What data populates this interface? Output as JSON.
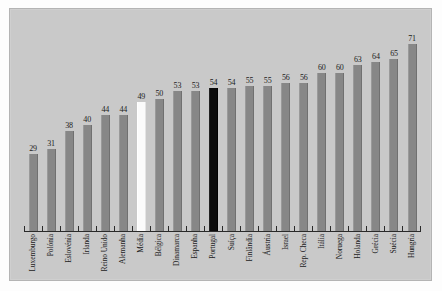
{
  "chart_data": {
    "type": "bar",
    "title": "",
    "subtitle": "",
    "xlabel": "",
    "ylabel": "",
    "ylim": [
      0,
      75
    ],
    "grid": false,
    "legend": "none",
    "orientation": "vertical",
    "categories": [
      "Luxemburgo",
      "Polónia",
      "Eslovénia",
      "Irlanda",
      "Reino Unido",
      "Alemanha",
      "Média",
      "Bélgica",
      "Dinamarca",
      "Espanha",
      "Portugal",
      "Suíça",
      "Finlândia",
      "Áustria",
      "Israel",
      "Rep. Checa",
      "Itália",
      "Noruega",
      "Holanda",
      "Grécia",
      "Suécia",
      "Hungria"
    ],
    "values": [
      29,
      31,
      38,
      40,
      44,
      44,
      49,
      50,
      53,
      53,
      54,
      54,
      55,
      55,
      56,
      56,
      60,
      60,
      63,
      64,
      65,
      71
    ],
    "bar_styles": [
      "normal",
      "normal",
      "normal",
      "normal",
      "normal",
      "normal",
      "average",
      "normal",
      "normal",
      "normal",
      "highlight",
      "normal",
      "normal",
      "normal",
      "normal",
      "normal",
      "normal",
      "normal",
      "normal",
      "normal",
      "normal",
      "normal"
    ],
    "colors": {
      "bar": "#878787",
      "highlight_bar": "#0a0a0a",
      "average_bar": "#fbfbfb",
      "plot_background": "#c9c9c9",
      "axis": "#2a2a2a",
      "text": "#1b1b1b"
    }
  }
}
